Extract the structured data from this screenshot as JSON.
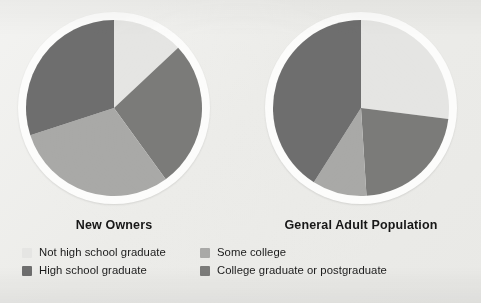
{
  "figure": {
    "background_color": "#ecece9",
    "ring_color": "#fcfcfb"
  },
  "legend": {
    "items": [
      {
        "label": "Not high school graduate",
        "color": "#e5e5e3"
      },
      {
        "label": "Some college",
        "color": "#a9a9a7"
      },
      {
        "label": "High school graduate",
        "color": "#6e6e6e"
      },
      {
        "label": "College graduate or postgraduate",
        "color": "#7b7b79"
      }
    ]
  },
  "chart_data": [
    {
      "type": "pie",
      "title": "New Owners",
      "categories": [
        "Not high school graduate",
        "College graduate or postgraduate",
        "Some college",
        "High school graduate"
      ],
      "values": [
        13,
        27,
        30,
        30
      ],
      "colors": [
        "#e5e5e3",
        "#7b7b79",
        "#a9a9a7",
        "#6e6e6e"
      ],
      "start_angle_deg": 0,
      "direction": "clockwise",
      "units": "percent",
      "legend_position": "bottom"
    },
    {
      "type": "pie",
      "title": "General Adult Population",
      "categories": [
        "Not high school graduate",
        "College graduate or postgraduate",
        "Some college",
        "High school graduate"
      ],
      "values": [
        27,
        22,
        10,
        41
      ],
      "colors": [
        "#e5e5e3",
        "#7b7b79",
        "#a9a9a7",
        "#6e6e6e"
      ],
      "start_angle_deg": 0,
      "direction": "clockwise",
      "units": "percent",
      "legend_position": "bottom"
    }
  ]
}
